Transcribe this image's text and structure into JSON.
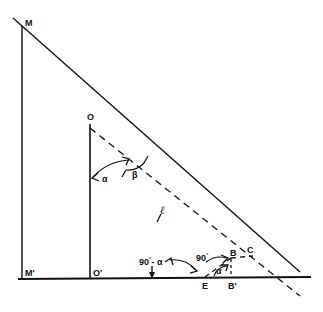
{
  "figure": {
    "stroke_color": "#111111",
    "background_color": "#ffffff"
  },
  "points": [
    {
      "id": "M",
      "label": "M",
      "x": 22,
      "y": 26,
      "label_x": 25,
      "label_y": 19
    },
    {
      "id": "O",
      "label": "O",
      "x": 90,
      "y": 124,
      "label_x": 87,
      "label_y": 113
    },
    {
      "id": "Mp",
      "label": "M'",
      "x": 22,
      "y": 279,
      "label_x": 25,
      "label_y": 269
    },
    {
      "id": "Op",
      "label": "O'",
      "x": 90,
      "y": 279,
      "label_x": 93,
      "label_y": 269
    },
    {
      "id": "E",
      "label": "E",
      "x": 205,
      "y": 279,
      "label_x": 202,
      "label_y": 282
    },
    {
      "id": "Bp",
      "label": "B'",
      "x": 231,
      "y": 279,
      "label_x": 228,
      "label_y": 282
    },
    {
      "id": "B",
      "label": "B",
      "x": 231,
      "y": 259,
      "label_x": 230,
      "label_y": 249
    },
    {
      "id": "C",
      "label": "C",
      "x": 252,
      "y": 257,
      "label_x": 247,
      "label_y": 246
    }
  ],
  "angles": [
    {
      "id": "alpha-at-O",
      "label": "α",
      "label_x": 102,
      "label_y": 175
    },
    {
      "id": "beta-at-O",
      "label": "β",
      "label_x": 132,
      "label_y": 173
    },
    {
      "id": "ninety-minus-alpha-at-E",
      "label_main": "90",
      "label_deg": "°",
      "label_tail": "- α",
      "label_x": 139,
      "label_y": 256
    },
    {
      "id": "ninety-at-B",
      "label_main": "90",
      "label_deg": "°",
      "label_x": 196,
      "label_y": 252
    },
    {
      "id": "alpha-at-Bprime",
      "label": "α",
      "label_x": 216,
      "label_y": 269
    }
  ],
  "lengths": [
    {
      "id": "segment-l",
      "label": "ℓ",
      "label_x": 160,
      "label_y": 210
    }
  ],
  "lines": {
    "solid": [
      {
        "id": "sight-line-M-C",
        "from": [
          13,
          18
        ],
        "to": [
          300,
          272
        ]
      },
      {
        "id": "vertical-M-Mprime",
        "from": [
          22,
          26
        ],
        "to": [
          22,
          279
        ]
      },
      {
        "id": "vertical-O-Oprime",
        "from": [
          90,
          124
        ],
        "to": [
          90,
          279
        ]
      },
      {
        "id": "baseline-Mprime-right",
        "from": [
          18,
          279
        ],
        "to": [
          311,
          277
        ]
      }
    ],
    "dashed": [
      {
        "id": "ray-O-through-E",
        "from": [
          90,
          128
        ],
        "to": [
          300,
          296
        ]
      },
      {
        "id": "segment-E-B",
        "from": [
          205,
          277
        ],
        "to": [
          231,
          259
        ]
      },
      {
        "id": "segment-B-C",
        "from": [
          231,
          259
        ],
        "to": [
          252,
          257
        ]
      },
      {
        "id": "vertical-B-Bprime",
        "from": [
          231,
          259
        ],
        "to": [
          231,
          278
        ]
      }
    ]
  }
}
